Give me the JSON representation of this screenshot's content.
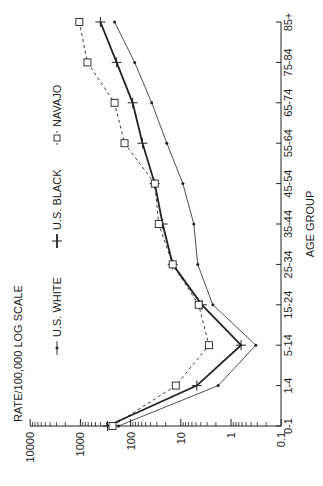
{
  "chart_data": {
    "type": "line",
    "title": "",
    "ylabel": "RATE/100,000 LOG SCALE",
    "xlabel": "AGE GROUP",
    "yscale": "log",
    "ylim": [
      0.1,
      10000
    ],
    "y_ticks": [
      "10000",
      "1000",
      "100",
      "10",
      "1",
      "0.1"
    ],
    "orientation": "rotated-90-ccw",
    "categories": [
      "0-1",
      "1-4",
      "5-14",
      "15-24",
      "25-34",
      "35-44",
      "45-54",
      "55-64",
      "65-74",
      "75-84",
      "85+"
    ],
    "series": [
      {
        "name": "U.S. WHITE",
        "marker": "dot",
        "line": "thin-solid",
        "values": [
          174,
          1.8,
          0.32,
          2.3,
          4.6,
          5.5,
          9.1,
          19,
          38,
          83,
          209
        ]
      },
      {
        "name": "U.S. BLACK",
        "marker": "plus",
        "line": "thick-solid",
        "values": [
          288,
          4.8,
          0.63,
          3.8,
          14.5,
          23,
          33,
          58,
          91,
          190,
          400
        ]
      },
      {
        "name": "NAVAJO",
        "marker": "square",
        "line": "dashed",
        "values": [
          229,
          12.6,
          2.75,
          4.4,
          14.5,
          27.5,
          33,
          132,
          209,
          725,
          1050
        ]
      }
    ],
    "legend_position": "top-inside",
    "grid": false
  },
  "colors": {
    "ink": "#222222",
    "background": "#ffffff"
  }
}
